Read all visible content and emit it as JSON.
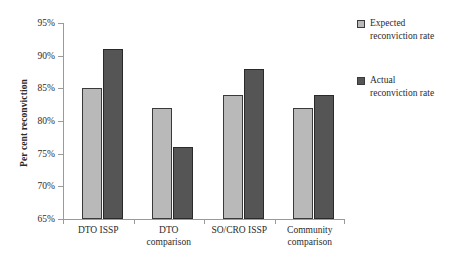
{
  "chart_data": {
    "type": "bar",
    "title": "",
    "xlabel": "",
    "ylabel": "Per cent reconviction",
    "ylim": [
      65,
      95
    ],
    "ytick_labels": [
      "95%",
      "90%",
      "85%",
      "80%",
      "75%",
      "70%",
      "65%"
    ],
    "ytick_values": [
      95,
      90,
      85,
      80,
      75,
      70,
      65
    ],
    "grid": false,
    "legend_position": "right",
    "categories": [
      "DTO ISSP",
      "DTO comparison",
      "SO/CRO ISSP",
      "Community comparison"
    ],
    "category_lines": [
      [
        "DTO ISSP"
      ],
      [
        "DTO",
        "comparison"
      ],
      [
        "SO/CRO ISSP"
      ],
      [
        "Community",
        "comparison"
      ]
    ],
    "series": [
      {
        "name": "Expected reconviction rate",
        "name_lines": [
          "Expected",
          "reconviction rate"
        ],
        "color": "#b9b9b9",
        "values": [
          85,
          82,
          84,
          82
        ]
      },
      {
        "name": "Actual reconviction rate",
        "name_lines": [
          "Actual",
          "reconviction rate"
        ],
        "color": "#555555",
        "values": [
          91,
          76,
          88,
          84
        ]
      }
    ]
  },
  "axis": {
    "line_color": "#9a9a9a"
  }
}
